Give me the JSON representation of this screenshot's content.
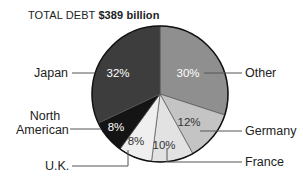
{
  "chart_data": {
    "type": "pie",
    "title_prefix": "TOTAL DEBT",
    "title_value": "$389 billion",
    "title": "TOTAL DEBT $389 billion",
    "slices": [
      {
        "label": "Other",
        "value": 30,
        "display": "30%",
        "color": "#8f8f8f",
        "text_color": "#ffffff"
      },
      {
        "label": "Germany",
        "value": 12,
        "display": "12%",
        "color": "#c4c4c4",
        "text_color": "#333333"
      },
      {
        "label": "France",
        "value": 10,
        "display": "10%",
        "color": "#e2e2e2",
        "text_color": "#333333"
      },
      {
        "label": "U.K.",
        "value": 8,
        "display": "8%",
        "color": "#efefef",
        "text_color": "#333333"
      },
      {
        "label": "North American",
        "value": 8,
        "display": "8%",
        "color": "#141414",
        "text_color": "#ffffff"
      },
      {
        "label": "Japan",
        "value": 32,
        "display": "32%",
        "color": "#3d3d3d",
        "text_color": "#ffffff"
      }
    ],
    "unit": "%"
  },
  "labels": {
    "japan": "Japan",
    "north": "North",
    "american": "American",
    "uk": "U.K.",
    "other": "Other",
    "germany": "Germany",
    "france": "France"
  },
  "pct": {
    "other": "30%",
    "germany": "12%",
    "france": "10%",
    "uk": "8%",
    "north_american": "8%",
    "japan": "32%"
  }
}
